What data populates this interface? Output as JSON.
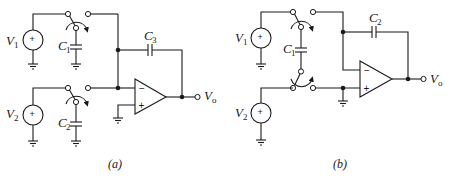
{
  "figure": {
    "panels": [
      {
        "id": "a",
        "caption": "(a)",
        "labels": {
          "source_top": "V",
          "source_top_sub": "1",
          "source_bottom": "V",
          "source_bottom_sub": "2",
          "cap_top": "C",
          "cap_top_sub": "1",
          "cap_bottom": "C",
          "cap_bottom_sub": "2",
          "cap_feedback": "C",
          "cap_feedback_sub": "3",
          "output": "V",
          "output_sub": "o",
          "opamp_minus": "−",
          "opamp_plus": "+",
          "source_sign": "+"
        }
      },
      {
        "id": "b",
        "caption": "(b)",
        "labels": {
          "source_top": "V",
          "source_top_sub": "1",
          "source_bottom": "V",
          "source_bottom_sub": "2",
          "cap_switched": "C",
          "cap_switched_sub": "1",
          "cap_feedback": "C",
          "cap_feedback_sub": "2",
          "output": "V",
          "output_sub": "o",
          "opamp_minus": "−",
          "opamp_plus": "+",
          "source_sign": "+"
        }
      }
    ]
  }
}
